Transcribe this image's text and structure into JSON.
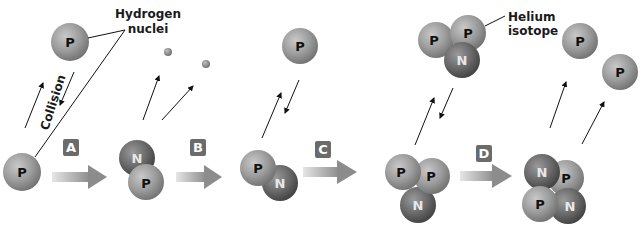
{
  "labels": {
    "hydrogen_line1": "Hydrogen",
    "hydrogen_line2": "nuclei",
    "helium_line1": "Helium",
    "helium_line2": "isotope",
    "collision": "Collision"
  },
  "steps": [
    "A",
    "B",
    "C",
    "D"
  ],
  "particles": {
    "proton": "P",
    "neutron": "N"
  },
  "colors": {
    "proton": "#9a9a9a",
    "neutron": "#6e6e6e",
    "step_box": "#6b6b6b",
    "arrow": "#a8a8a8",
    "line": "#111111",
    "background": "#ffffff"
  }
}
